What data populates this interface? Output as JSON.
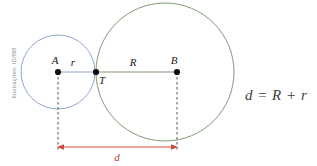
{
  "figure": {
    "credit": "Ilustrações: ID/BR",
    "background_color": "#ffffff"
  },
  "colors": {
    "small_circle_stroke": "#8da8d0",
    "large_circle_stroke": "#7f9c74",
    "segment_stroke": "#7f9c74",
    "segment_stroke_left": "#8da8d0",
    "point_fill": "#111111",
    "dashed_stroke": "#555555",
    "dimension_stroke": "#cf4a3c",
    "label_color": "#1a1a1a",
    "formula_color": "#3d3d3d",
    "credit_color": "#8f8f8f"
  },
  "circles": [
    {
      "name": "small-circle",
      "center_label": "A",
      "cx": 58,
      "cy": 72,
      "r": 37,
      "radius_label": "r"
    },
    {
      "name": "large-circle",
      "center_label": "B",
      "cx": 165,
      "cy": 72,
      "r": 69,
      "radius_label": "R"
    }
  ],
  "points": [
    {
      "label": "A",
      "x": 58,
      "y": 72,
      "label_x": 55,
      "label_y": 64
    },
    {
      "label": "T",
      "x": 96,
      "y": 72,
      "label_x": 99,
      "label_y": 84
    },
    {
      "label": "B",
      "x": 177,
      "y": 72,
      "label_x": 174,
      "label_y": 64
    }
  ],
  "segments": [
    {
      "name": "segment-r",
      "label": "r",
      "from": "A",
      "to": "T",
      "label_x": 73,
      "label_y": 66
    },
    {
      "name": "segment-R",
      "label": "R",
      "from": "T",
      "to": "B",
      "label_x": 133,
      "label_y": 66
    }
  ],
  "dimension": {
    "label": "d",
    "label_x": 117,
    "label_y": 160,
    "x1": 58,
    "x2": 177,
    "y": 147
  },
  "formula": {
    "text": "d = R + r",
    "x": 245,
    "y": 100
  }
}
